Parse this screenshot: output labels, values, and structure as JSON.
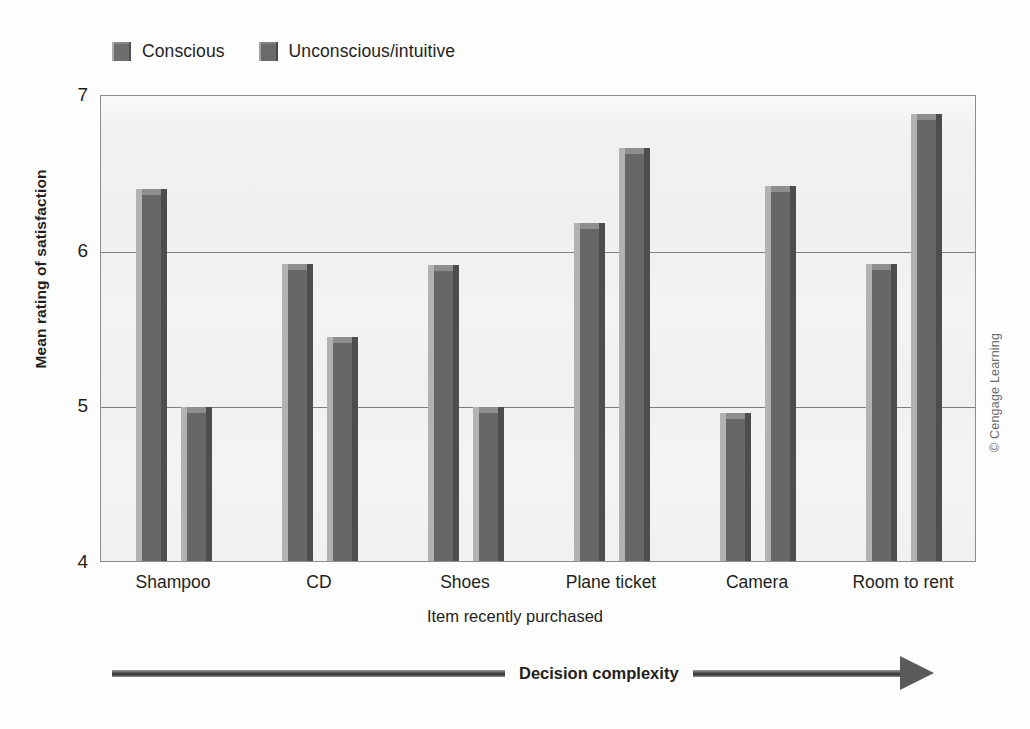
{
  "legend": {
    "items": [
      {
        "label": "Conscious",
        "icon": "square-swatch",
        "color": "#6e6e6e"
      },
      {
        "label": "Unconscious/intuitive",
        "icon": "square-swatch",
        "color": "#6a6a6a"
      }
    ]
  },
  "axes": {
    "y_title": "Mean rating of satisfaction",
    "x_title": "Item recently purchased",
    "y_ticks": [
      "7",
      "6",
      "5",
      "4"
    ]
  },
  "annotation": {
    "complexity_label": "Decision complexity",
    "arrow_direction": "right"
  },
  "credit": "© Cengage Learning",
  "chart_data": {
    "type": "bar",
    "title": "",
    "xlabel": "Item recently purchased",
    "ylabel": "Mean rating of satisfaction",
    "ylim": [
      4,
      7
    ],
    "yticks": [
      4,
      5,
      6,
      7
    ],
    "grid": "horizontal",
    "legend_position": "top-left",
    "categories": [
      "Shampoo",
      "CD",
      "Shoes",
      "Plane ticket",
      "Camera",
      "Room to rent"
    ],
    "series": [
      {
        "name": "Conscious",
        "color": "#6e6e6e",
        "values": [
          6.39,
          5.91,
          5.9,
          6.17,
          4.95,
          5.91
        ]
      },
      {
        "name": "Unconscious/intuitive",
        "color": "#6a6a6a",
        "values": [
          4.99,
          5.44,
          4.99,
          6.65,
          6.41,
          6.87
        ]
      }
    ],
    "annotation": "Decision complexity increases from left to right"
  }
}
